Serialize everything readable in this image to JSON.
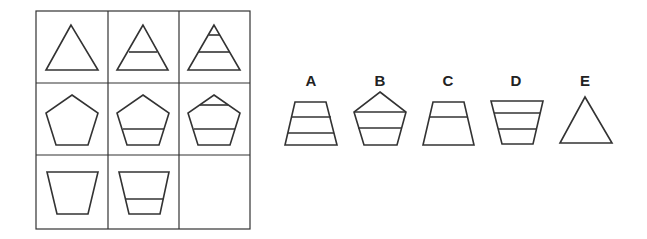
{
  "puzzle": {
    "grid": {
      "rows": 3,
      "cols": 3,
      "cells": [
        {
          "row": 1,
          "col": 1,
          "shape": "triangle",
          "dividers": 0
        },
        {
          "row": 1,
          "col": 2,
          "shape": "triangle",
          "dividers": 1
        },
        {
          "row": 1,
          "col": 3,
          "shape": "triangle",
          "dividers": 2
        },
        {
          "row": 2,
          "col": 1,
          "shape": "pentagon",
          "dividers": 0
        },
        {
          "row": 2,
          "col": 2,
          "shape": "pentagon",
          "dividers": 1
        },
        {
          "row": 2,
          "col": 3,
          "shape": "pentagon",
          "dividers": 2
        },
        {
          "row": 3,
          "col": 1,
          "shape": "inverted-trapezoid",
          "dividers": 0
        },
        {
          "row": 3,
          "col": 2,
          "shape": "inverted-trapezoid",
          "dividers": 1
        },
        {
          "row": 3,
          "col": 3,
          "shape": "empty",
          "dividers": null
        }
      ]
    },
    "options": [
      {
        "label": "A",
        "shape": "trapezoid",
        "dividers": 2
      },
      {
        "label": "B",
        "shape": "pentagon",
        "dividers": 2
      },
      {
        "label": "C",
        "shape": "trapezoid",
        "dividers": 1
      },
      {
        "label": "D",
        "shape": "inverted-trapezoid",
        "dividers": 2
      },
      {
        "label": "E",
        "shape": "triangle",
        "dividers": 0
      }
    ]
  }
}
